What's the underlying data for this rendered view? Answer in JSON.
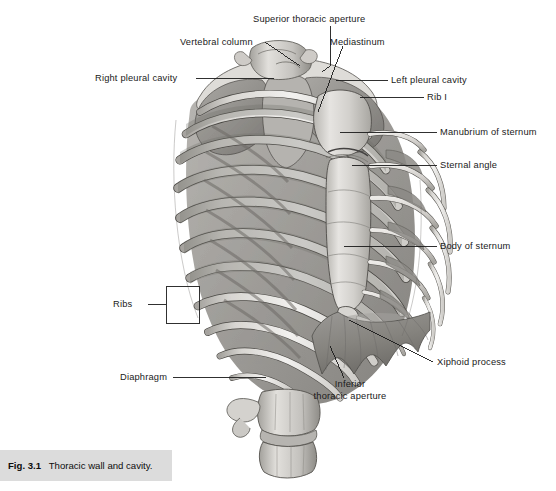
{
  "figure": {
    "title": "Thoracic wall and cavity",
    "caption_number": "Fig. 3.1",
    "caption_text": "Thoracic wall and cavity.",
    "top_cropped_text": "",
    "colors": {
      "background": "#ffffff",
      "caption_band": "#dcdcdc",
      "leader_line": "#1a1a1a",
      "bone_light": "#f2f1ef",
      "bone_mid": "#c9c7c4",
      "bone_shadow": "#9a9894",
      "cavity_dark": "#8d8b88",
      "diaphragm": "#8a8885",
      "outline": "#4a4a4a",
      "text": "#1a1a1a"
    }
  },
  "labels": [
    {
      "id": "superior-thoracic-aperture",
      "text": "Superior thoracic aperture",
      "side": "top",
      "x": 253,
      "y": 14
    },
    {
      "id": "vertebral-column",
      "text": "Vertebral column",
      "side": "left",
      "x": 180,
      "y": 37
    },
    {
      "id": "mediastinum",
      "text": "Mediastinum",
      "side": "right",
      "x": 330,
      "y": 37
    },
    {
      "id": "right-pleural-cavity",
      "text": "Right pleural cavity",
      "side": "left",
      "x": 95,
      "y": 74
    },
    {
      "id": "left-pleural-cavity",
      "text": "Left pleural cavity",
      "side": "right",
      "x": 391,
      "y": 76
    },
    {
      "id": "rib-i",
      "text": "Rib I",
      "side": "right",
      "x": 427,
      "y": 93
    },
    {
      "id": "manubrium-of-sternum",
      "text": "Manubrium of sternum",
      "side": "right",
      "x": 440,
      "y": 128
    },
    {
      "id": "sternal-angle",
      "text": "Sternal angle",
      "side": "right",
      "x": 440,
      "y": 161
    },
    {
      "id": "body-of-sternum",
      "text": "Body of sternum",
      "side": "right",
      "x": 440,
      "y": 242
    },
    {
      "id": "ribs",
      "text": "Ribs",
      "side": "left",
      "x": 113,
      "y": 300
    },
    {
      "id": "xiphoid-process",
      "text": "Xiphoid process",
      "side": "right",
      "x": 437,
      "y": 358
    },
    {
      "id": "diaphragm",
      "text": "Diaphragm",
      "side": "left",
      "x": 120,
      "y": 373
    },
    {
      "id": "inferior-thoracic-aperture",
      "text": "Inferior\nthoracic aperture",
      "side": "bottom",
      "x": 302,
      "y": 381
    }
  ],
  "label_text": {
    "superior_thoracic_aperture": "Superior thoracic aperture",
    "vertebral_column": "Vertebral column",
    "mediastinum": "Mediastinum",
    "right_pleural_cavity": "Right pleural cavity",
    "left_pleural_cavity": "Left pleural cavity",
    "rib_i": "Rib I",
    "manubrium_of_sternum": "Manubrium of sternum",
    "sternal_angle": "Sternal angle",
    "body_of_sternum": "Body of sternum",
    "ribs": "Ribs",
    "xiphoid_process": "Xiphoid process",
    "diaphragm": "Diaphragm",
    "inferior_thoracic_aperture_line1": "Inferior",
    "inferior_thoracic_aperture_line2": "thoracic aperture"
  },
  "anatomy": {
    "view": "anterior oblique view of the thoracic skeleton",
    "structures": [
      "thoracic vertebrae / vertebral column",
      "rib I through rib XII",
      "costal cartilages",
      "manubrium of sternum",
      "sternal angle",
      "body of sternum",
      "xiphoid process",
      "right pleural cavity",
      "left pleural cavity",
      "mediastinum",
      "superior thoracic aperture",
      "inferior thoracic aperture",
      "diaphragm"
    ],
    "rib_count_visible": 10
  }
}
